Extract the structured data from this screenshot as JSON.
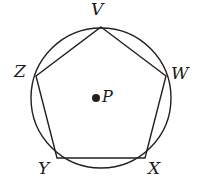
{
  "figure": {
    "stroke_color": "#231f20",
    "background_color": "#ffffff",
    "stroke_width": 1.4
  },
  "circle": {
    "name": "circumscribed-circle",
    "center_x": 101,
    "center_y": 98,
    "radius": 70
  },
  "center_point": {
    "label": "P",
    "dot_x": 96,
    "dot_y": 98,
    "dot_radius": 4
  },
  "vertices": [
    {
      "label": "V",
      "x": 101,
      "y": 27
    },
    {
      "label": "W",
      "x": 166,
      "y": 76
    },
    {
      "label": "X",
      "x": 145,
      "y": 158
    },
    {
      "label": "Y",
      "x": 57,
      "y": 158
    },
    {
      "label": "Z",
      "x": 36,
      "y": 76
    }
  ],
  "polygon": {
    "name": "pentagon-VWXYZ",
    "points": "101,27 166,76 145,158 57,158 36,76",
    "sides": 5
  },
  "chart_data": {
    "type": "diagram",
    "shapes": [
      {
        "kind": "circle",
        "label": "P",
        "center": [
          101,
          98
        ],
        "radius": 70
      },
      {
        "kind": "polygon",
        "label": "VWXYZ",
        "vertices": [
          {
            "name": "V",
            "point": [
              101,
              27
            ]
          },
          {
            "name": "W",
            "point": [
              166,
              76
            ]
          },
          {
            "name": "X",
            "point": [
              145,
              158
            ]
          },
          {
            "name": "Y",
            "point": [
              57,
              158
            ]
          },
          {
            "name": "Z",
            "point": [
              36,
              76
            ]
          }
        ]
      },
      {
        "kind": "point",
        "label": "P",
        "point": [
          96,
          98
        ]
      }
    ],
    "annotations": [
      "V",
      "W",
      "X",
      "Y",
      "Z",
      "P"
    ]
  }
}
